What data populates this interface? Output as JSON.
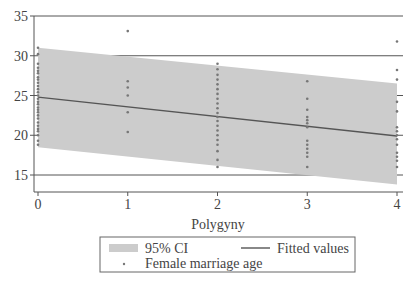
{
  "chart_data": {
    "type": "scatter",
    "title": "",
    "xlabel": "Polygyny",
    "ylabel": "",
    "xlim": [
      -0.05,
      4.05
    ],
    "ylim": [
      12.8,
      35
    ],
    "x_ticks": [
      0,
      1,
      2,
      3,
      4
    ],
    "x_tick_labels": [
      "0",
      "1",
      "2",
      "3",
      "4"
    ],
    "y_ticks": [
      15,
      20,
      25,
      30,
      35
    ],
    "y_tick_labels": [
      "15",
      "20",
      "25",
      "30",
      "35"
    ],
    "grid": "horizontal",
    "legend": {
      "placement": "bottom",
      "entries": [
        {
          "label": "95% CI",
          "kind": "band"
        },
        {
          "label": "Fitted values",
          "kind": "line"
        },
        {
          "label": "Female marriage age",
          "kind": "marker"
        }
      ]
    },
    "fitted": {
      "x": [
        0,
        4
      ],
      "y": [
        24.8,
        19.9
      ]
    },
    "ci_band": {
      "x": [
        0,
        4
      ],
      "upper": [
        31.0,
        26.5
      ],
      "lower": [
        18.5,
        13.8
      ]
    },
    "series": [
      {
        "name": "Female marriage age",
        "points": [
          [
            0,
            31.0
          ],
          [
            0,
            30.2
          ],
          [
            0,
            29.0
          ],
          [
            0,
            28.5
          ],
          [
            0,
            28.1
          ],
          [
            0,
            27.8
          ],
          [
            0,
            27.3
          ],
          [
            0,
            27.0
          ],
          [
            0,
            26.6
          ],
          [
            0,
            26.2
          ],
          [
            0,
            25.8
          ],
          [
            0,
            25.4
          ],
          [
            0,
            25.0
          ],
          [
            0,
            24.6
          ],
          [
            0,
            24.2
          ],
          [
            0,
            23.9
          ],
          [
            0,
            23.5
          ],
          [
            0,
            23.2
          ],
          [
            0,
            22.9
          ],
          [
            0,
            22.5
          ],
          [
            0,
            22.1
          ],
          [
            0,
            21.6
          ],
          [
            0,
            21.2
          ],
          [
            0,
            20.8
          ],
          [
            0,
            20.5
          ],
          [
            0,
            20.0
          ],
          [
            0,
            19.3
          ],
          [
            0,
            18.8
          ],
          [
            1,
            33.1
          ],
          [
            1,
            26.8
          ],
          [
            1,
            26.0
          ],
          [
            1,
            25.0
          ],
          [
            1,
            22.9
          ],
          [
            1,
            20.4
          ],
          [
            2,
            29.0
          ],
          [
            2,
            28.3
          ],
          [
            2,
            27.6
          ],
          [
            2,
            27.0
          ],
          [
            2,
            26.4
          ],
          [
            2,
            25.8
          ],
          [
            2,
            25.2
          ],
          [
            2,
            24.6
          ],
          [
            2,
            24.0
          ],
          [
            2,
            23.4
          ],
          [
            2,
            22.8
          ],
          [
            2,
            22.3
          ],
          [
            2,
            21.8
          ],
          [
            2,
            21.2
          ],
          [
            2,
            20.6
          ],
          [
            2,
            20.0
          ],
          [
            2,
            19.4
          ],
          [
            2,
            18.8
          ],
          [
            2,
            18.0
          ],
          [
            2,
            16.9
          ],
          [
            2,
            16.0
          ],
          [
            3,
            26.8
          ],
          [
            3,
            24.6
          ],
          [
            3,
            23.2
          ],
          [
            3,
            22.3
          ],
          [
            3,
            21.9
          ],
          [
            3,
            21.5
          ],
          [
            3,
            21.0
          ],
          [
            3,
            19.3
          ],
          [
            3,
            18.8
          ],
          [
            3,
            18.3
          ],
          [
            3,
            17.8
          ],
          [
            3,
            17.3
          ],
          [
            3,
            16.0
          ],
          [
            4,
            31.8
          ],
          [
            4,
            28.2
          ],
          [
            4,
            27.0
          ],
          [
            4,
            24.2
          ],
          [
            4,
            23.0
          ],
          [
            4,
            21.0
          ],
          [
            4,
            20.5
          ],
          [
            4,
            20.0
          ],
          [
            4,
            19.5
          ],
          [
            4,
            18.8
          ],
          [
            4,
            17.8
          ],
          [
            4,
            17.3
          ],
          [
            4,
            16.8
          ],
          [
            4,
            16.0
          ]
        ]
      }
    ]
  },
  "colors": {
    "band": "#cccccc",
    "line": "#555555",
    "marker": "#777777",
    "axis": "#555555",
    "grid": "#555555"
  }
}
